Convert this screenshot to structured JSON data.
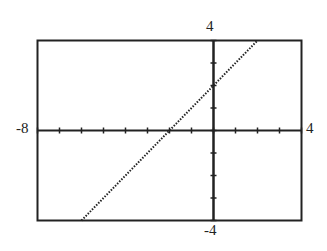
{
  "chart_data": {
    "type": "line",
    "title": "",
    "xlabel": "",
    "ylabel": "",
    "xlim": [
      -8,
      4
    ],
    "ylim": [
      -4,
      4
    ],
    "xtick_step": 1,
    "ytick_step": 1,
    "grid": false,
    "series": [
      {
        "name": "y = x + 2",
        "style": "dotted",
        "x": [
          -6,
          -4,
          -2,
          0,
          2
        ],
        "y": [
          -4,
          -2,
          0,
          2,
          4
        ]
      }
    ],
    "labels": {
      "xmin": "-8",
      "xmax": "4",
      "ymax": "4",
      "ymin": "-4"
    }
  }
}
